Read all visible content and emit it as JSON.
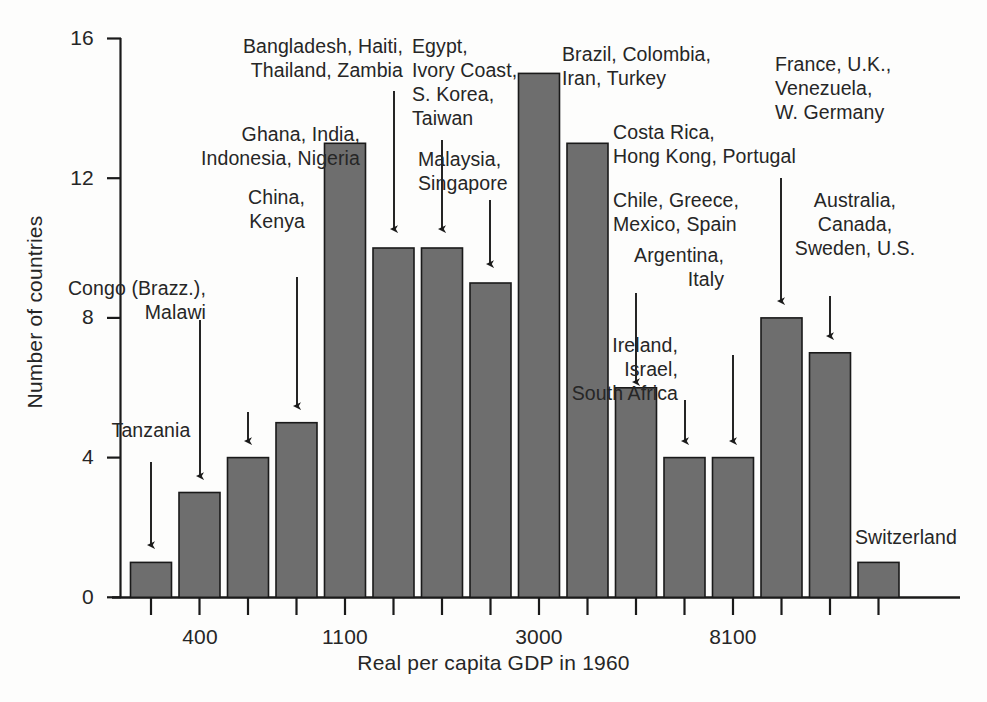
{
  "figure": {
    "width": 987,
    "height": 702,
    "background": "#fdfdfc",
    "bar_fill": "#6e6e6e",
    "bar_stroke": "#1a1a1a",
    "axis_color": "#1a1a1a",
    "text_color": "#262626"
  },
  "chart_data": {
    "type": "bar",
    "title": "",
    "xlabel": "Real per capita GDP in 1960",
    "ylabel": "Number of countries",
    "ylim": [
      0,
      16
    ],
    "ytick_values": [
      0,
      4,
      8,
      12,
      16
    ],
    "ytick_labels": [
      "0",
      "4",
      "8",
      "12",
      "16"
    ],
    "grid": false,
    "legend": "none",
    "bin_count": 16,
    "xtick_labels": [
      "",
      "400",
      "",
      "",
      "1100",
      "",
      "",
      "",
      "3000",
      "",
      "",
      "",
      "8100",
      "",
      "",
      ""
    ],
    "labelled_xticks": [
      {
        "index": 1,
        "label": "400"
      },
      {
        "index": 4,
        "label": "1100"
      },
      {
        "index": 8,
        "label": "3000"
      },
      {
        "index": 12,
        "label": "8100"
      }
    ],
    "categories": [
      "bin1",
      "bin2",
      "bin3",
      "bin4",
      "bin5",
      "bin6",
      "bin7",
      "bin8",
      "bin9",
      "bin10",
      "bin11",
      "bin12",
      "bin13",
      "bin14",
      "bin15",
      "bin16"
    ],
    "values": [
      1,
      3,
      4,
      5,
      13,
      10,
      10,
      9,
      15,
      13,
      6,
      4,
      4,
      8,
      7,
      1
    ],
    "bin_countries": [
      "Tanzania",
      "Congo (Brazz.), Malawi",
      "Ethiopia, Pakistan",
      "China, Kenya",
      "Ghana, India, Indonesia, Nigeria",
      "Bangladesh, Haiti, Thailand, Zambia",
      "Egypt, Ivory Coast, S. Korea, Taiwan",
      "Malaysia, Singapore",
      "Brazil, Colombia, Iran, Turkey",
      "Costa Rica, Hong Kong, Portugal",
      "Chile, Greece, Mexico, Spain",
      "Ireland, Israel, South Africa",
      "Argentina, Italy",
      "France, U.K., Venezuela, W. Germany",
      "Australia, Canada, Sweden, U.S.",
      "Switzerland"
    ]
  },
  "annotations": [
    {
      "id": "tanzania",
      "text": "Tanzania",
      "lines": [
        "Tanzania"
      ],
      "align": "center"
    },
    {
      "id": "congo-malawi",
      "text": "Congo (Brazz.), Malawi",
      "lines": [
        "Congo (Brazz.),",
        "Malawi"
      ],
      "align": "right"
    },
    {
      "id": "ethiopia-pak",
      "text": "Ethiopia, Pakistan",
      "lines": [
        "Ethiopia,",
        "Pakistan"
      ],
      "align": "right"
    },
    {
      "id": "china-kenya",
      "text": "China, Kenya",
      "lines": [
        "China,",
        "Kenya"
      ],
      "align": "right"
    },
    {
      "id": "ghana-india",
      "text": "Ghana, India, Indonesia, Nigeria",
      "lines": [
        "Ghana, India,",
        "Indonesia, Nigeria"
      ],
      "align": "right"
    },
    {
      "id": "bangladesh",
      "text": "Bangladesh, Haiti, Thailand, Zambia",
      "lines": [
        "Bangladesh, Haiti,",
        "Thailand, Zambia"
      ],
      "align": "right"
    },
    {
      "id": "egypt",
      "text": "Egypt, Ivory Coast, S. Korea, Taiwan",
      "lines": [
        "Egypt,",
        "Ivory Coast,",
        "S. Korea,",
        "Taiwan"
      ],
      "align": "left"
    },
    {
      "id": "malaysia",
      "text": "Malaysia, Singapore",
      "lines": [
        "Malaysia,",
        "Singapore"
      ],
      "align": "left"
    },
    {
      "id": "brazil",
      "text": "Brazil, Colombia, Iran, Turkey",
      "lines": [
        "Brazil, Colombia,",
        "Iran, Turkey"
      ],
      "align": "left"
    },
    {
      "id": "costa-rica",
      "text": "Costa Rica, Hong Kong, Portugal",
      "lines": [
        "Costa Rica,",
        "Hong Kong, Portugal"
      ],
      "align": "left"
    },
    {
      "id": "chile",
      "text": "Chile, Greece, Mexico, Spain",
      "lines": [
        "Chile, Greece,",
        "Mexico, Spain"
      ],
      "align": "left"
    },
    {
      "id": "ireland",
      "text": "Ireland, Israel, South Africa",
      "lines": [
        "Ireland,",
        "Israel,",
        "South Africa"
      ],
      "align": "right"
    },
    {
      "id": "argentina",
      "text": "Argentina, Italy",
      "lines": [
        "Argentina,",
        "Italy"
      ],
      "align": "right"
    },
    {
      "id": "france",
      "text": "France, U.K., Venezuela, W. Germany",
      "lines": [
        "France, U.K.,",
        "Venezuela,",
        "W. Germany"
      ],
      "align": "left"
    },
    {
      "id": "australia",
      "text": "Australia, Canada, Sweden, U.S.",
      "lines": [
        "Australia,",
        "Canada,",
        "Sweden, U.S."
      ],
      "align": "center"
    },
    {
      "id": "switzerland",
      "text": "Switzerland",
      "lines": [
        "Switzerland"
      ],
      "align": "left"
    }
  ]
}
